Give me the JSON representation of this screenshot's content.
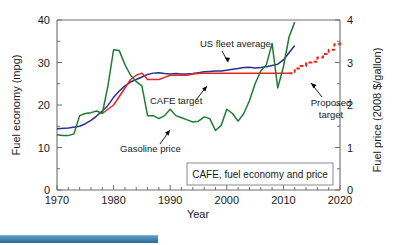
{
  "chart_data": {
    "type": "line",
    "title": "CAFE, fuel economy and price",
    "xlabel": "Year",
    "ylabel": "Fuel economy (mpg)",
    "y2label": "Fuel price (2008 $/gallon)",
    "xlim": [
      1970,
      2020
    ],
    "ylim": [
      0,
      40
    ],
    "y2lim": [
      0,
      4
    ],
    "grid": false,
    "legend_position": "inline-annotations",
    "xticks": [
      1970,
      1980,
      1990,
      2000,
      2010,
      2020
    ],
    "xticklabels": [
      "1970",
      "1980",
      "1990",
      "2000",
      "2010",
      "2020"
    ],
    "yticks": [
      0,
      10,
      20,
      30,
      40
    ],
    "yticklabels": [
      "0",
      "10",
      "20",
      "30",
      "40"
    ],
    "y2ticks": [
      0,
      1,
      2,
      3,
      4
    ],
    "y2ticklabels": [
      "0",
      "1",
      "2",
      "3",
      "4"
    ],
    "annotations": [
      {
        "label": "US fleet average",
        "x": 1994.5,
        "y": 36.0
      },
      {
        "label": "CAFE target",
        "x": 1988.5,
        "y": 24.0
      },
      {
        "label": "Gasoline price",
        "x": 1985.0,
        "y": 12.2
      },
      {
        "label": "Proposed target",
        "x": 2014.0,
        "y": 19.0
      }
    ],
    "series": [
      {
        "name": "US fleet average",
        "color": "#2b2f8f",
        "style": "solid",
        "axis": "left",
        "unit": "mpg",
        "x": [
          1970,
          1972,
          1974,
          1975,
          1976,
          1977,
          1978,
          1979,
          1980,
          1981,
          1982,
          1983,
          1984,
          1985,
          1986,
          1987,
          1988,
          1989,
          1990,
          1991,
          1992,
          1993,
          1994,
          1995,
          1996,
          1997,
          1998,
          1999,
          2000,
          2001,
          2002,
          2003,
          2004,
          2005,
          2006,
          2007,
          2008,
          2009,
          2010,
          2011,
          2012
        ],
        "y": [
          14.4,
          14.6,
          15.0,
          15.6,
          16.4,
          17.4,
          18.6,
          19.9,
          21.8,
          23.3,
          24.5,
          25.4,
          26.0,
          26.6,
          27.2,
          27.5,
          27.6,
          27.4,
          27.3,
          27.4,
          27.3,
          27.3,
          27.4,
          27.6,
          27.8,
          27.9,
          28.0,
          28.0,
          28.2,
          28.4,
          28.6,
          28.8,
          28.9,
          28.7,
          28.8,
          29.0,
          29.3,
          29.6,
          30.6,
          32.3,
          34.0
        ]
      },
      {
        "name": "CAFE target",
        "color": "#e8251f",
        "style": "solid",
        "axis": "left",
        "unit": "mpg",
        "x": [
          1978,
          1979,
          1980,
          1981,
          1982,
          1983,
          1984,
          1985,
          1986,
          1987,
          1988,
          1989,
          1990,
          1991,
          1992,
          1993,
          1994,
          1995,
          1996,
          1997,
          1998,
          1999,
          2000,
          2001,
          2002,
          2003,
          2004,
          2005,
          2006,
          2007,
          2008,
          2009,
          2010,
          2011
        ],
        "y": [
          18.0,
          19.0,
          20.0,
          22.0,
          24.0,
          26.0,
          27.0,
          27.5,
          26.0,
          26.0,
          26.0,
          26.5,
          27.0,
          27.0,
          27.0,
          27.0,
          27.3,
          27.4,
          27.5,
          27.5,
          27.5,
          27.5,
          27.5,
          27.5,
          27.5,
          27.5,
          27.5,
          27.5,
          27.5,
          27.5,
          27.5,
          27.5,
          27.5,
          27.5
        ]
      },
      {
        "name": "Proposed target",
        "color": "#e8251f",
        "style": "dashed",
        "axis": "left",
        "unit": "mpg",
        "x": [
          2011,
          2012,
          2013,
          2014,
          2015,
          2016,
          2017,
          2018,
          2019,
          2020
        ],
        "y": [
          27.5,
          28.6,
          29.2,
          30.0,
          30.2,
          31.2,
          32.0,
          33.0,
          34.3,
          35.0
        ]
      },
      {
        "name": "Gasoline price",
        "color": "#1f7a32",
        "style": "solid",
        "axis": "right",
        "unit": "2008 $/gallon",
        "x": [
          1970,
          1971,
          1972,
          1973,
          1974,
          1975,
          1976,
          1977,
          1978,
          1979,
          1980,
          1981,
          1982,
          1983,
          1984,
          1985,
          1986,
          1987,
          1988,
          1989,
          1990,
          1991,
          1992,
          1993,
          1994,
          1995,
          1996,
          1997,
          1998,
          1999,
          2000,
          2001,
          2002,
          2003,
          2004,
          2005,
          2006,
          2007,
          2008,
          2009,
          2010,
          2011,
          2012
        ],
        "y": [
          1.3,
          1.28,
          1.28,
          1.32,
          1.75,
          1.8,
          1.82,
          1.86,
          1.8,
          2.45,
          3.3,
          3.28,
          2.95,
          2.7,
          2.55,
          2.45,
          1.75,
          1.75,
          1.68,
          1.75,
          1.9,
          1.75,
          1.7,
          1.65,
          1.6,
          1.62,
          1.72,
          1.68,
          1.4,
          1.52,
          1.9,
          1.8,
          1.62,
          1.8,
          2.1,
          2.5,
          2.8,
          2.95,
          3.45,
          2.4,
          2.9,
          3.6,
          3.95
        ]
      }
    ]
  },
  "caption": {
    "box_label": "CAFE, fuel economy and price"
  },
  "axes": {
    "left_title": "Fuel economy (mpg)",
    "right_title": "Fuel price (2008 $/gallon)",
    "bottom_title": "Year"
  }
}
